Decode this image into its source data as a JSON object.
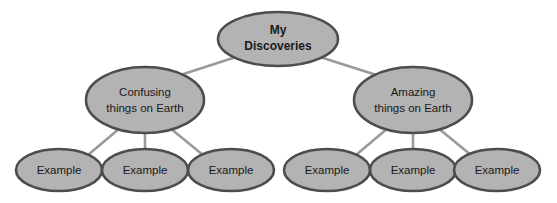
{
  "diagram": {
    "type": "concept-map-tree",
    "background_color": "#ffffff",
    "node_fill_color": "#b3b3b3",
    "node_border_color": "#4d4d4d",
    "connector_color": "#9a9a9a",
    "text_color": "#1a1a1a",
    "root": {
      "label_line1": "My",
      "label_line2": "Discoveries"
    },
    "branches": [
      {
        "label_line1": "Confusing",
        "label_line2": "things on Earth",
        "leaves": [
          {
            "label": "Example"
          },
          {
            "label": "Example"
          },
          {
            "label": "Example"
          }
        ]
      },
      {
        "label_line1": "Amazing",
        "label_line2": "things on Earth",
        "leaves": [
          {
            "label": "Example"
          },
          {
            "label": "Example"
          },
          {
            "label": "Example"
          }
        ]
      }
    ]
  }
}
